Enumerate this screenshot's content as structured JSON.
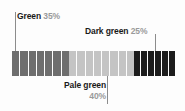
{
  "figure": {
    "background_color": "#fdfdfd",
    "leader_line_color": "#8c8c8c"
  },
  "labels": {
    "green": {
      "name": "Green",
      "pct": "35%"
    },
    "dark_green": {
      "name": "Dark green",
      "pct": "25%"
    },
    "pale_green": {
      "name": "Pale green",
      "pct": "40%"
    }
  },
  "chart_data": {
    "type": "bar",
    "title": "",
    "subtitle": "",
    "xlabel": "",
    "ylabel": "",
    "orientation": "horizontal",
    "stacked": true,
    "grid": false,
    "legend_position": "annotations-with-leader-lines",
    "total": 100,
    "units": "percent",
    "categories": [
      "Green",
      "Pale green",
      "Dark green"
    ],
    "values": [
      35,
      40,
      25
    ],
    "value_labels": [
      "35%",
      "40%",
      "25%"
    ],
    "colors": [
      "#6e6e6e",
      "#c4c4c4",
      "#1c1c1c"
    ],
    "segment_counts": [
      7,
      8,
      6
    ],
    "segment_divider_color": "#fdfdfd",
    "annotations": [
      {
        "text": "Green 35%",
        "target_category": "Green",
        "side": "top",
        "leader": true
      },
      {
        "text": "Dark green 25%",
        "target_category": "Dark green",
        "side": "top",
        "leader": true
      },
      {
        "text": "Pale green 40%",
        "target_category": "Pale green",
        "side": "bottom",
        "leader": true
      }
    ]
  }
}
